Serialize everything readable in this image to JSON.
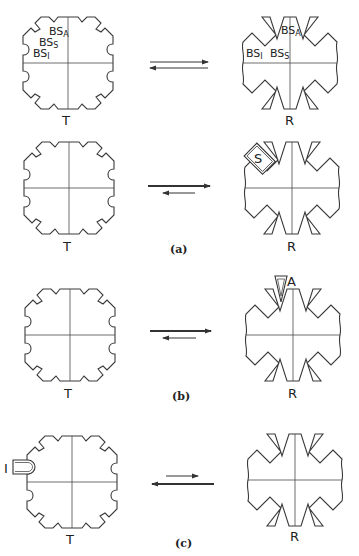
{
  "figure": {
    "rows": [
      {
        "id": "row1",
        "left_label": "T",
        "right_label": "R",
        "site_labels_T": {
          "bs_a": "BS",
          "bs_a_sub": "A",
          "bs_s": "BS",
          "bs_s_sub": "S",
          "bs_i": "BS",
          "bs_i_sub": "I"
        },
        "site_labels_R": {
          "bs_a": "BS",
          "bs_a_sub": "A",
          "bs_s": "BS",
          "bs_s_sub": "S",
          "bs_i": "BS",
          "bs_i_sub": "I"
        },
        "equilibrium": "balanced"
      },
      {
        "id": "row2",
        "left_label": "T",
        "right_label": "R",
        "ligand_label": "S",
        "ligand_on": "R",
        "equilibrium": "favors R",
        "panel_label": "(a)"
      },
      {
        "id": "row3",
        "left_label": "T",
        "right_label": "R",
        "ligand_label": "A",
        "ligand_on": "R",
        "equilibrium": "favors R",
        "panel_label": "(b)"
      },
      {
        "id": "row4",
        "left_label": "T",
        "right_label": "R",
        "ligand_label": "I",
        "ligand_on": "T",
        "equilibrium": "favors T",
        "panel_label": "(c)"
      }
    ],
    "colors": {
      "line": "#3a3a3a",
      "background": "#ffffff"
    }
  }
}
